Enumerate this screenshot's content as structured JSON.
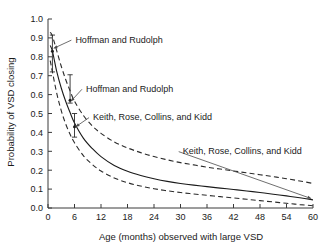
{
  "chart_data": {
    "type": "line",
    "title": "",
    "xlabel": "Age (months) observed with large VSD",
    "ylabel": "Probability of VSD closing",
    "xlim": [
      0,
      60
    ],
    "ylim": [
      0.0,
      1.0
    ],
    "grid": false,
    "legend_position": "inline-annotations",
    "xticks": [
      "0",
      "6",
      "12",
      "18",
      "24",
      "30",
      "36",
      "42",
      "48",
      "54",
      "60"
    ],
    "xtick_values": [
      0,
      6,
      12,
      18,
      24,
      30,
      36,
      42,
      48,
      54,
      60
    ],
    "yticks": [
      "0.0",
      "0.1",
      "0.2",
      "0.3",
      "0.4",
      "0.5",
      "0.6",
      "0.7",
      "0.8",
      "0.9",
      "1.0"
    ],
    "ytick_values": [
      0.0,
      0.1,
      0.2,
      0.3,
      0.4,
      0.5,
      0.6,
      0.7,
      0.8,
      0.9,
      1.0
    ],
    "x": [
      0.5,
      1,
      2,
      3,
      4,
      5,
      6,
      8,
      10,
      12,
      15,
      18,
      21,
      24,
      27,
      30,
      33,
      36,
      39,
      42,
      45,
      48,
      51,
      54,
      57,
      60
    ],
    "series": [
      {
        "name": "Upper 95% bound",
        "style": "dashed",
        "values": [
          0.93,
          0.91,
          0.83,
          0.75,
          0.68,
          0.62,
          0.565,
          0.49,
          0.435,
          0.395,
          0.35,
          0.318,
          0.293,
          0.272,
          0.255,
          0.24,
          0.228,
          0.216,
          0.206,
          0.196,
          0.186,
          0.176,
          0.166,
          0.155,
          0.143,
          0.13
        ]
      },
      {
        "name": "Central estimate",
        "style": "solid",
        "values": [
          0.86,
          0.83,
          0.72,
          0.635,
          0.565,
          0.505,
          0.45,
          0.37,
          0.315,
          0.272,
          0.225,
          0.194,
          0.172,
          0.155,
          0.141,
          0.13,
          0.121,
          0.113,
          0.105,
          0.098,
          0.09,
          0.082,
          0.073,
          0.064,
          0.054,
          0.043
        ]
      },
      {
        "name": "Lower 95% bound",
        "style": "dashed",
        "values": [
          0.78,
          0.72,
          0.605,
          0.515,
          0.445,
          0.39,
          0.345,
          0.277,
          0.231,
          0.196,
          0.159,
          0.134,
          0.116,
          0.102,
          0.091,
          0.082,
          0.074,
          0.067,
          0.06,
          0.053,
          0.046,
          0.039,
          0.032,
          0.025,
          0.018,
          0.012
        ]
      }
    ],
    "error_bars": [
      {
        "x": 1,
        "y": 0.83,
        "ymin": 0.72,
        "ymax": 0.915,
        "label": "Hoffman and Rudolph"
      },
      {
        "x": 5,
        "y": 0.57,
        "ymin": 0.555,
        "ymax": 0.705,
        "label": "Hoffman and Rudolph"
      },
      {
        "x": 6,
        "y": 0.43,
        "ymin": 0.375,
        "ymax": 0.5,
        "label": "Keith, Rose, Collins, and Kidd"
      }
    ],
    "annotations": [
      {
        "text": "Hoffman and Rudolph",
        "x": 6.2,
        "y": 0.875,
        "points_to_x": 1.3,
        "points_to_y": 0.845
      },
      {
        "text": "Hoffman and Rudolph",
        "x": 8.6,
        "y": 0.615,
        "points_to_x": 5.2,
        "points_to_y": 0.565
      },
      {
        "text": "Keith, Rose, Collins, and Kidd",
        "x": 10.2,
        "y": 0.465,
        "points_to_x": 6.3,
        "points_to_y": 0.43
      },
      {
        "text": "Keith, Rose, Collins, and Kidd",
        "x": 30.5,
        "y": 0.285,
        "points_to_x": 59.6,
        "points_to_y": 0.05
      }
    ]
  }
}
